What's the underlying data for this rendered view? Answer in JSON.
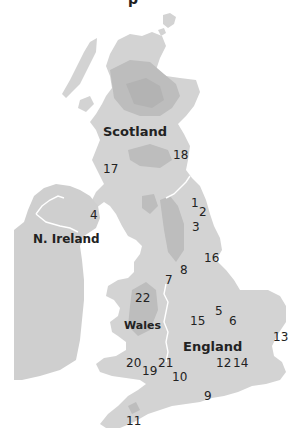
{
  "title_fragment": "p",
  "regions": {
    "scotland": "Scotland",
    "n_ireland": "N. Ireland",
    "wales": "Wales",
    "england": "England"
  },
  "markers": [
    {
      "id": "1",
      "label": "1"
    },
    {
      "id": "2",
      "label": "2"
    },
    {
      "id": "3",
      "label": "3"
    },
    {
      "id": "4",
      "label": "4"
    },
    {
      "id": "5",
      "label": "5"
    },
    {
      "id": "6",
      "label": "6"
    },
    {
      "id": "7",
      "label": "7"
    },
    {
      "id": "8",
      "label": "8"
    },
    {
      "id": "9",
      "label": "9"
    },
    {
      "id": "10",
      "label": "10"
    },
    {
      "id": "11",
      "label": "11"
    },
    {
      "id": "12",
      "label": "12"
    },
    {
      "id": "13",
      "label": "13"
    },
    {
      "id": "14",
      "label": "14"
    },
    {
      "id": "15",
      "label": "15"
    },
    {
      "id": "16",
      "label": "16"
    },
    {
      "id": "17",
      "label": "17"
    },
    {
      "id": "18",
      "label": "18"
    },
    {
      "id": "19",
      "label": "19"
    },
    {
      "id": "20",
      "label": "20"
    },
    {
      "id": "21",
      "label": "21"
    },
    {
      "id": "22",
      "label": "22"
    }
  ],
  "colors": {
    "land": "#d3d3d3",
    "highland": "#bdbdbd",
    "border": "#ffffff",
    "text": "#222222"
  }
}
